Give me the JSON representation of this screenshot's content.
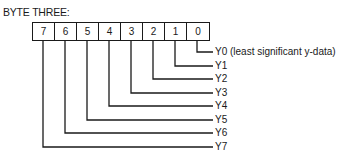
{
  "title": "BYTE THREE:",
  "bits": [
    "7",
    "6",
    "5",
    "4",
    "3",
    "2",
    "1",
    "0"
  ],
  "labels": [
    {
      "bit": "0",
      "text": "Y0 (least significant y-data)",
      "y": 52
    },
    {
      "bit": "1",
      "text": "Y1",
      "y": 66
    },
    {
      "bit": "2",
      "text": "Y2",
      "y": 79
    },
    {
      "bit": "3",
      "text": "Y3",
      "y": 93
    },
    {
      "bit": "4",
      "text": "Y4",
      "y": 106
    },
    {
      "bit": "5",
      "text": "Y5",
      "y": 120
    },
    {
      "bit": "6",
      "text": "Y6",
      "y": 133
    },
    {
      "bit": "7",
      "text": "Y7",
      "y": 147
    }
  ]
}
